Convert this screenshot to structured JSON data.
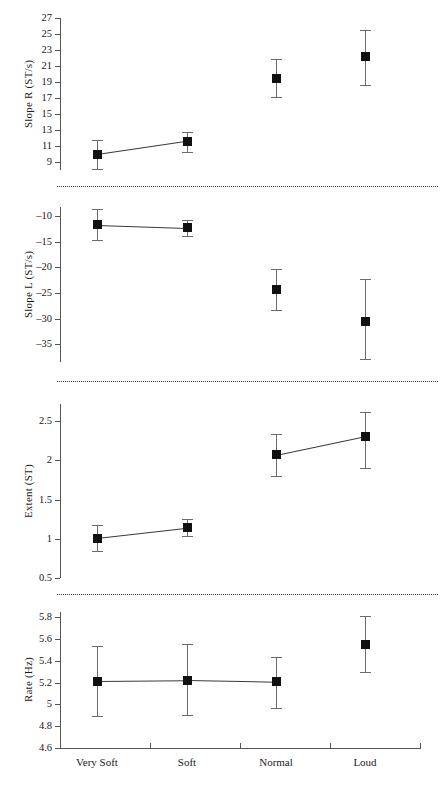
{
  "chart_data": {
    "type": "scatter",
    "title": "",
    "xlabel": "",
    "categories": [
      "Very Soft",
      "Soft",
      "Normal",
      "Loud"
    ],
    "grid": false,
    "legend": "none",
    "panels": [
      {
        "id": "slope-r",
        "ylabel": "Slope R (ST/s)",
        "ylim": [
          8,
          27
        ],
        "yticks": [
          27,
          25,
          23,
          21,
          19,
          17,
          15,
          13,
          11,
          9
        ],
        "ytick_labels": [
          "27",
          "25",
          "23",
          "21",
          "19",
          "17",
          "15",
          "13",
          "11",
          "9"
        ],
        "values": [
          9.95,
          11.6,
          19.5,
          22.15
        ],
        "err_low": [
          8.1,
          10.25,
          17.1,
          18.6
        ],
        "err_high": [
          11.8,
          12.8,
          21.9,
          25.5
        ],
        "connect": [
          [
            0,
            1
          ]
        ]
      },
      {
        "id": "slope-l",
        "ylabel": "Slope L (ST/s)",
        "ylim": [
          -38.5,
          -8.2
        ],
        "yticks": [
          -10,
          -15,
          -20,
          -25,
          -30,
          -35
        ],
        "ytick_labels": [
          "–10",
          "–15",
          "–20",
          "–25",
          "–30",
          "–35"
        ],
        "values": [
          -11.7,
          -12.3,
          -24.4,
          -30.5
        ],
        "err_low": [
          -14.6,
          -13.9,
          -28.3,
          -38.0
        ],
        "err_high": [
          -8.6,
          -10.8,
          -20.4,
          -22.2
        ],
        "connect": [
          [
            0,
            1
          ]
        ]
      },
      {
        "id": "extent",
        "ylabel": "Extent (ST)",
        "ylim": [
          0.5,
          2.72
        ],
        "yticks": [
          2.5,
          2,
          1.5,
          1,
          0.5
        ],
        "ytick_labels": [
          "2.5",
          "2",
          "1.5",
          "1",
          "0.5"
        ],
        "values": [
          1.01,
          1.14,
          2.07,
          2.31
        ],
        "err_low": [
          0.84,
          1.04,
          1.8,
          1.9
        ],
        "err_high": [
          1.18,
          1.25,
          2.34,
          2.62
        ],
        "connect": [
          [
            0,
            1
          ],
          [
            2,
            3
          ]
        ]
      },
      {
        "id": "rate",
        "ylabel": "Rate (Hz)",
        "ylim": [
          4.6,
          5.85
        ],
        "yticks": [
          5.8,
          5.6,
          5.4,
          5.2,
          5,
          4.8,
          4.6
        ],
        "ytick_labels": [
          "5.8",
          "5.6",
          "5.4",
          "5.2",
          "5",
          "4.8",
          "4.6"
        ],
        "values": [
          5.215,
          5.222,
          5.207,
          5.555
        ],
        "err_low": [
          4.89,
          4.9,
          4.965,
          5.3
        ],
        "err_high": [
          5.54,
          5.555,
          5.44,
          5.81
        ],
        "connect": [
          [
            0,
            1
          ],
          [
            1,
            2
          ]
        ]
      }
    ]
  },
  "style": {
    "marker_color": "#111111",
    "error_color": "#6b6b6b",
    "axis_color": "#555555",
    "separator_color": "#444444",
    "connector_color": "#3a3a3a"
  }
}
